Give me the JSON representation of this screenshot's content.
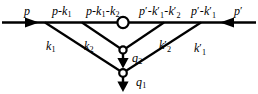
{
  "figure": {
    "name": "ladder-diagram",
    "type": "feynman-like-diagram",
    "background_color": "#ffffff",
    "line_color": "#000000"
  },
  "labels": {
    "incoming_left": {
      "symbol": "p",
      "prime": "",
      "sub": ""
    },
    "left_seg_1": {
      "symbol": "p",
      "op": "-",
      "symbol2": "k",
      "sub2": "1"
    },
    "left_seg_2": {
      "symbol": "p",
      "op": "-",
      "symbol2": "k",
      "sub2": "1",
      "op2": "-",
      "symbol3": "k",
      "sub3": "2"
    },
    "right_seg_2": {
      "symbol": "p",
      "prime": "′",
      "op": "-",
      "symbol2": "k",
      "prime2": "′",
      "sub2": "1",
      "op2": "-",
      "symbol3": "k",
      "prime3": "′",
      "sub3": "2"
    },
    "right_seg_1": {
      "symbol": "p",
      "prime": "′",
      "op": "-",
      "symbol2": "k",
      "prime2": "′",
      "sub2": "1"
    },
    "incoming_right": {
      "symbol": "p",
      "prime": "′"
    },
    "rung_k1": {
      "symbol": "k",
      "sub": "1"
    },
    "rung_k2": {
      "symbol": "k",
      "sub": "2"
    },
    "rung_k2p": {
      "symbol": "k",
      "prime": "′",
      "sub": "2"
    },
    "rung_k1p": {
      "symbol": "k",
      "prime": "′",
      "sub": "1"
    },
    "out_q2": {
      "symbol": "q",
      "sub": "2"
    },
    "out_q1": {
      "symbol": "q",
      "sub": "1"
    }
  },
  "label_text": {
    "p": "p",
    "p_minus_k1": "p-k",
    "p_minus_k1_k2": "p-k",
    "pp_minus_k1p_k2p": "p",
    "pp_minus_k1p": "p",
    "pp": "p",
    "k1": "k",
    "k2": "k",
    "k2p": "k",
    "k1p": "k",
    "q2": "q",
    "q1": "q"
  },
  "subscripts": {
    "one": "1",
    "two": "2"
  },
  "prime": "′",
  "minus": "-",
  "nodes": {
    "top_blob": {
      "cx": 123,
      "cy": 22.5,
      "r": 5.6,
      "filled": false
    },
    "vertex_q2": {
      "cx": 123,
      "cy": 50,
      "r": 3.6,
      "filled": false
    },
    "vertex_q1": {
      "cx": 123,
      "cy": 73,
      "r": 3.8,
      "filled": false
    }
  },
  "edges": {
    "horizontal_left_y": 22.5,
    "horizontal_right_y": 22.5,
    "left_end_x": 2,
    "right_end_x": 256,
    "branch_left_outer_x": 45,
    "branch_left_inner_x": 82,
    "branch_right_inner_x": 164,
    "branch_right_outer_x": 201
  },
  "arrows": {
    "incoming_left": {
      "x": 33,
      "y": 22.5,
      "direction": "right"
    },
    "incoming_right": {
      "x": 226,
      "y": 22.5,
      "direction": "left"
    },
    "out_q2": {
      "x": 123,
      "y": 64,
      "direction": "down"
    },
    "out_q1": {
      "x": 123,
      "y": 88,
      "direction": "down"
    }
  }
}
